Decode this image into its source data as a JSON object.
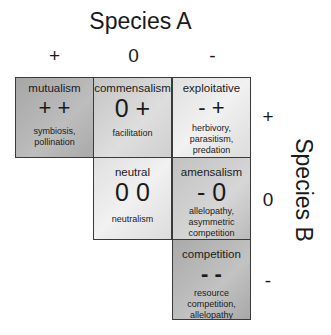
{
  "species_a": {
    "title": "Species A",
    "signs": [
      "+",
      "0",
      "-"
    ]
  },
  "species_b": {
    "title": "Species B",
    "signs": [
      "+",
      "0",
      "-"
    ]
  },
  "cells": [
    {
      "name": "mutualism",
      "sign": "+ +",
      "examples": "symbiosis, pollination",
      "row": 0,
      "col": 0
    },
    {
      "name": "commensalism",
      "sign": "0 +",
      "examples": "facilitation",
      "row": 0,
      "col": 1
    },
    {
      "name": "exploitative",
      "sign": "- +",
      "examples": "herbivory, parasitism, predation",
      "row": 0,
      "col": 2
    },
    {
      "name": "neutral",
      "sign": "0 0",
      "examples": "neutralism",
      "row": 1,
      "col": 1
    },
    {
      "name": "amensalism",
      "sign": "- 0",
      "examples": "allelopathy, asymmetric competition",
      "row": 1,
      "col": 2
    },
    {
      "name": "competition",
      "sign": "- -",
      "examples": "resource competition, allelopathy",
      "row": 2,
      "col": 2
    }
  ]
}
